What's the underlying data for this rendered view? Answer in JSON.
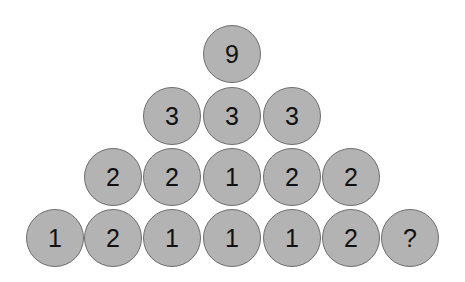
{
  "puzzle": {
    "rows": [
      {
        "y": 54,
        "cells": [
          {
            "x": 232,
            "label": "9"
          }
        ]
      },
      {
        "y": 116,
        "cells": [
          {
            "x": 172,
            "label": "3"
          },
          {
            "x": 232,
            "label": "3"
          },
          {
            "x": 292,
            "label": "3"
          }
        ]
      },
      {
        "y": 177,
        "cells": [
          {
            "x": 113,
            "label": "2"
          },
          {
            "x": 172,
            "label": "2"
          },
          {
            "x": 232,
            "label": "1"
          },
          {
            "x": 292,
            "label": "2"
          },
          {
            "x": 351,
            "label": "2"
          }
        ]
      },
      {
        "y": 238,
        "cells": [
          {
            "x": 55,
            "label": "1"
          },
          {
            "x": 113,
            "label": "2"
          },
          {
            "x": 172,
            "label": "1"
          },
          {
            "x": 232,
            "label": "1"
          },
          {
            "x": 292,
            "label": "1"
          },
          {
            "x": 351,
            "label": "2"
          },
          {
            "x": 410,
            "label": "?"
          }
        ]
      }
    ],
    "colors": {
      "fill": "#b3b3b3",
      "stroke": "#6e6e6e",
      "text": "#111111"
    }
  }
}
